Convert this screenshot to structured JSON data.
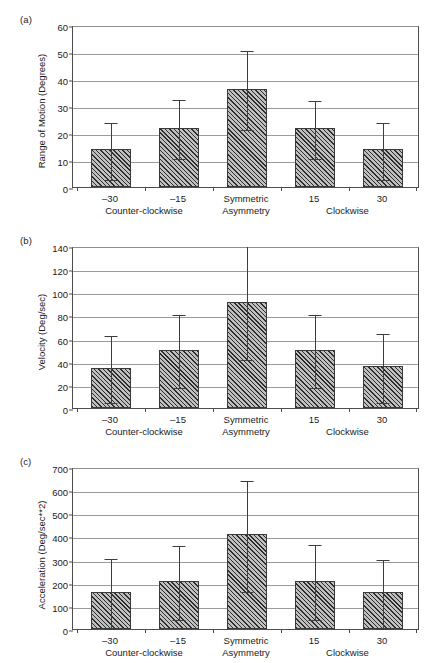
{
  "figure": {
    "panels": [
      {
        "id": "a",
        "label": "(a)"
      },
      {
        "id": "b",
        "label": "(b)"
      },
      {
        "id": "c",
        "label": "(c)"
      }
    ]
  },
  "axis": {
    "categories": [
      "–30",
      "–15",
      "Symmetric\nAsymmetry",
      "15",
      "30"
    ],
    "category_lines": [
      [
        "–30"
      ],
      [
        "–15"
      ],
      [
        "Symmetric",
        "Asymmetry"
      ],
      [
        "15"
      ],
      [
        "30"
      ]
    ],
    "groups": [
      {
        "label": "Counter-clockwise"
      },
      {
        "label": "Clockwise"
      }
    ]
  },
  "chart_data": [
    {
      "type": "bar",
      "panel": "(a)",
      "title": "",
      "xlabel": "",
      "ylabel": "Range of Motion (Degrees)",
      "ylim": [
        0,
        60
      ],
      "yticks": [
        0,
        10,
        20,
        30,
        40,
        50,
        60
      ],
      "ytick_labels": [
        "0",
        "10",
        "20",
        "30",
        "40",
        "50",
        "60"
      ],
      "grid": true,
      "legend": "none",
      "categories": [
        "–30",
        "–15",
        "Symmetric Asymmetry",
        "15",
        "30"
      ],
      "values": [
        14.2,
        22.0,
        36.3,
        22.0,
        14.2
      ],
      "error_low": [
        3.3,
        11.0,
        21.8,
        11.0,
        3.3
      ],
      "error_high": [
        24.4,
        33.0,
        51.0,
        32.7,
        24.4
      ]
    },
    {
      "type": "bar",
      "panel": "(b)",
      "title": "",
      "xlabel": "",
      "ylabel": "Velocity (Deg/sec)",
      "ylim": [
        0,
        140
      ],
      "yticks": [
        0,
        20,
        40,
        60,
        80,
        100,
        120,
        140
      ],
      "ytick_labels": [
        "0",
        "20",
        "40",
        "60",
        "80",
        "100",
        "120",
        "140"
      ],
      "grid": true,
      "legend": "none",
      "categories": [
        "–30",
        "–15",
        "Symmetric Asymmetry",
        "15",
        "30"
      ],
      "values": [
        35.0,
        50.5,
        92.0,
        50.4,
        36.2
      ],
      "error_low": [
        6.0,
        19.0,
        43.5,
        19.0,
        6.0
      ],
      "error_high": [
        64.0,
        82.0,
        140.5,
        81.8,
        65.5
      ]
    },
    {
      "type": "bar",
      "panel": "(c)",
      "title": "",
      "xlabel": "",
      "ylabel": "Acceleration (Deg/sec**2)",
      "ylim": [
        0,
        700
      ],
      "yticks": [
        0,
        100,
        200,
        300,
        400,
        500,
        600,
        700
      ],
      "ytick_labels": [
        "0",
        "100",
        "200",
        "300",
        "400",
        "500",
        "600",
        "700"
      ],
      "grid": true,
      "legend": "none",
      "categories": [
        "–30",
        "–15",
        "Symmetric Asymmetry",
        "15",
        "30"
      ],
      "values": [
        160,
        208,
        410,
        208,
        158
      ],
      "error_low": [
        8,
        48,
        170,
        48,
        8
      ],
      "error_high": [
        310,
        368,
        650,
        370,
        308
      ]
    }
  ]
}
